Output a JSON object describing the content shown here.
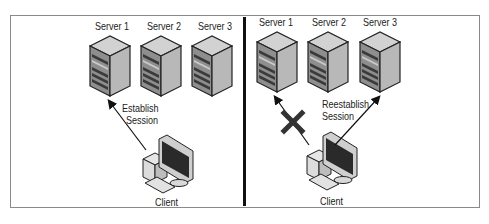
{
  "diagram": {
    "panels": [
      {
        "id": "before",
        "servers": [
          {
            "label": "Server 1"
          },
          {
            "label": "Server 2"
          },
          {
            "label": "Server 3"
          }
        ],
        "connection_label_line1": "Establish",
        "connection_label_line2": "Session",
        "client_label": "Client"
      },
      {
        "id": "after",
        "servers": [
          {
            "label": "Server 1"
          },
          {
            "label": "Server 2"
          },
          {
            "label": "Server 3"
          }
        ],
        "connection_label_line1": "Reestablish",
        "connection_label_line2": "Session",
        "client_label": "Client",
        "failed_marker": "x-mark"
      }
    ],
    "colors": {
      "server_front": "#8f8f8f",
      "server_side": "#b5b5b5",
      "server_top": "#d0d0d0",
      "monitor_screen": "#2a2a2a",
      "divider": "#111111",
      "frame_border": "#8a8a8a",
      "x_mark": "#333333"
    }
  }
}
